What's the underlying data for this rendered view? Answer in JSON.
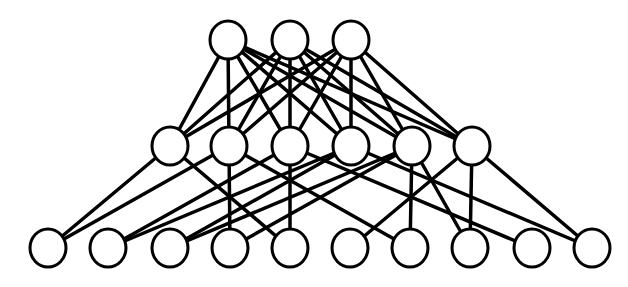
{
  "diagram": {
    "type": "layered-network",
    "stroke_color": "#000000",
    "node_fill": "#ffffff",
    "node_radius": 19,
    "edge_width": 3.5,
    "layers": [
      {
        "name": "top",
        "y": 40,
        "x": [
          228,
          290,
          351
        ]
      },
      {
        "name": "middle",
        "y": 146,
        "x": [
          170,
          229,
          290,
          351,
          412,
          472
        ]
      },
      {
        "name": "bottom",
        "y": 248,
        "x": [
          48,
          108,
          170,
          230,
          290,
          350,
          410,
          470,
          532,
          592
        ]
      }
    ],
    "edges_top_middle": [
      [
        0,
        0
      ],
      [
        0,
        1
      ],
      [
        0,
        2
      ],
      [
        0,
        3
      ],
      [
        0,
        4
      ],
      [
        0,
        5
      ],
      [
        1,
        0
      ],
      [
        1,
        1
      ],
      [
        1,
        2
      ],
      [
        1,
        3
      ],
      [
        1,
        4
      ],
      [
        1,
        5
      ],
      [
        2,
        0
      ],
      [
        2,
        1
      ],
      [
        2,
        2
      ],
      [
        2,
        3
      ],
      [
        2,
        4
      ],
      [
        2,
        5
      ]
    ],
    "edges_middle_bottom": [
      [
        0,
        0
      ],
      [
        0,
        4
      ],
      [
        1,
        0
      ],
      [
        1,
        3
      ],
      [
        1,
        6
      ],
      [
        2,
        1
      ],
      [
        2,
        4
      ],
      [
        2,
        8
      ],
      [
        3,
        1
      ],
      [
        3,
        2
      ],
      [
        3,
        9
      ],
      [
        4,
        2
      ],
      [
        4,
        3
      ],
      [
        4,
        6
      ],
      [
        4,
        7
      ],
      [
        5,
        7
      ],
      [
        5,
        9
      ],
      [
        5,
        5
      ]
    ]
  }
}
